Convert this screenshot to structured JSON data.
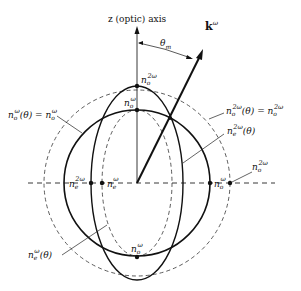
{
  "diagram": {
    "axis_label": "z (optic) axis",
    "wave_vector": {
      "base": "k",
      "sup": "ω"
    },
    "angle": {
      "base": "θ",
      "sub": "m"
    },
    "labels": {
      "no_2w_top": {
        "base": "n",
        "sub": "o",
        "sup": "2ω"
      },
      "no_w_top": {
        "base": "n",
        "sub": "o",
        "sup": "ω"
      },
      "no_w_circle": "n_o^ω(θ) = n_o^ω",
      "no_w_circle_parts": {
        "left": "n",
        "left_sub": "o",
        "left_sup": "ω",
        "mid": "(θ) = n",
        "right_sub": "o",
        "right_sup": "ω"
      },
      "no_2w_circle_parts": {
        "left": "n",
        "left_sub": "o",
        "left_sup": "2ω",
        "mid": "(θ) = n",
        "right_sub": "o",
        "right_sup": "2ω"
      },
      "ne_2w_theta": {
        "base": "n",
        "sub": "e",
        "sup": "2ω",
        "tail": "(θ)"
      },
      "ne_2w": {
        "base": "n",
        "sub": "e",
        "sup": "2ω"
      },
      "ne_w": {
        "base": "n",
        "sub": "e",
        "sup": "ω"
      },
      "no_w_right": {
        "base": "n",
        "sub": "o",
        "sup": "ω"
      },
      "no_2w_right": {
        "base": "n",
        "sub": "o",
        "sup": "2ω"
      },
      "ne_w_theta": {
        "base": "n",
        "sub": "e",
        "sup": "ω",
        "tail": "(θ)"
      },
      "no_w_bottom": {
        "base": "n",
        "sub": "o",
        "sup": "ω"
      }
    }
  }
}
